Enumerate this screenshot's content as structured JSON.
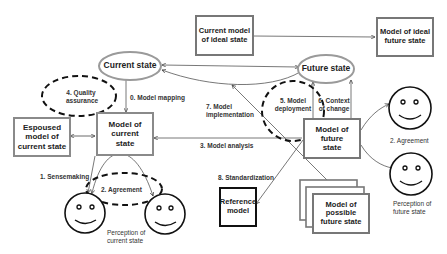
{
  "diagram": {
    "nodes": {
      "current_model_ideal_state": "Current model of ideal state",
      "model_ideal_future_state": "Model of ideal future state",
      "current_state": "Current state",
      "future_state": "Future state",
      "espoused_model_current_state": "Espoused model of current state",
      "model_current_state": "Model of current state",
      "model_future_state": "Model of future state",
      "reference_model": "Reference model",
      "model_possible_future_state": "Model of possible future state"
    },
    "labels": {
      "quality_assurance": "4. Quality assurance",
      "model_mapping": "0. Model mapping",
      "model_implementation": "7. Model implementation",
      "model_deployment": "5. Model deployment",
      "context_of_change": "6. Context of change",
      "model_analysis": "3. Model analysis",
      "agreement_right": "2. Agreement",
      "perception_future_state": "Perception of future state",
      "sensemaking": "1. Sensemaking",
      "agreement_left": "2. Agreement",
      "perception_current_state": "Perception of current state",
      "standardization": "8. Standardization"
    },
    "colors": {
      "line": "#555555",
      "gray_border": "#8a8a8a",
      "dashed": "#111111",
      "ellipse_border": "#9a9a9a"
    }
  }
}
